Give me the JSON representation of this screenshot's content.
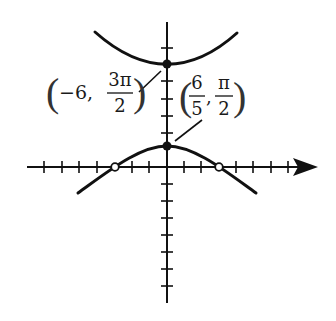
{
  "figure": {
    "type": "graph-of-polar-or-trig-curves",
    "colors": {
      "ink": "#111111",
      "background": "#ffffff"
    },
    "axes": {
      "x_axis": {
        "from": 27,
        "to": 318,
        "y": 167,
        "arrow": "right"
      },
      "y_axis": {
        "x": 167,
        "from": 22,
        "to": 303,
        "arrow": "none"
      },
      "x_ticks": [
        44,
        62,
        79,
        97,
        132,
        149,
        184,
        201,
        236,
        253,
        271,
        288
      ],
      "y_ticks": [
        48,
        81,
        99,
        116,
        133,
        184,
        201,
        218,
        235,
        252,
        269,
        286
      ]
    },
    "curves": [
      {
        "name": "upper-branch",
        "points": "M95,32 Q167,96 237,33"
      },
      {
        "name": "lower-branch",
        "points": "M78,193 C110,170 140,146 167,146 C194,146 224,170 256,193"
      }
    ],
    "filled_points": [
      {
        "name": "upper-vertex",
        "x": 167,
        "y": 64
      },
      {
        "name": "lower-vertex",
        "x": 167,
        "y": 146
      }
    ],
    "open_points": [
      {
        "name": "left-x-intercept",
        "x": 115,
        "y": 167
      },
      {
        "name": "right-x-intercept",
        "x": 219,
        "y": 167
      }
    ],
    "labels": {
      "upper_point": {
        "open_paren": "(",
        "prefix": "−6,",
        "numerator": "3π",
        "denominator": "2",
        "close_paren": ")"
      },
      "lower_point": {
        "open_paren": "(",
        "first_numerator": "6",
        "first_denominator": "5",
        "comma": ",",
        "second_numerator": "π",
        "second_denominator": "2",
        "close_paren": ")"
      }
    }
  }
}
